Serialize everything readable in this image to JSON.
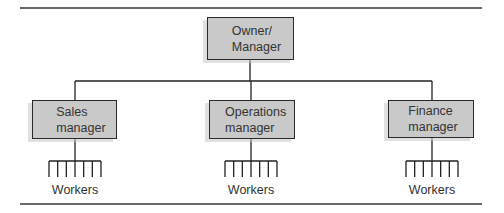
{
  "diagram": {
    "type": "organizational-chart",
    "top": {
      "label": "Owner/\nManager"
    },
    "managers": [
      {
        "label": "Sales\nmanager",
        "workers_label": "Workers",
        "worker_count": 7
      },
      {
        "label": "Operations\nmanager",
        "workers_label": "Workers",
        "worker_count": 7
      },
      {
        "label": "Finance\nmanager",
        "workers_label": "Workers",
        "worker_count": 7
      }
    ]
  },
  "colors": {
    "box_fill": "#c9c9c9",
    "box_border": "#2a2a2a",
    "line": "#222222",
    "rule": "#6a6a6a",
    "text": "#333333"
  }
}
